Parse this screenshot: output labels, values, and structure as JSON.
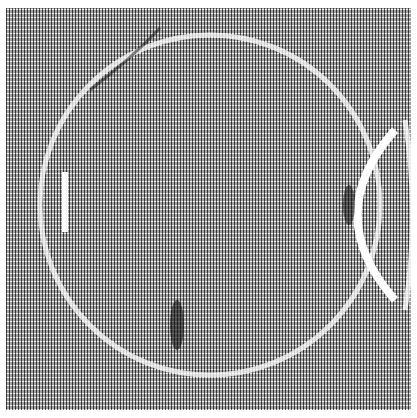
{
  "image": {
    "description": "Grayscale dithered texture resembling a rubbing of a circular carved surface with vertical hatch marks",
    "colors": {
      "ink": "#1a1a1a",
      "paper": "#ffffff",
      "mid": "#8a8a8a"
    },
    "features": [
      {
        "name": "large-arc-outline",
        "shape": "circle",
        "cx": 210,
        "cy": 205,
        "r": 170
      },
      {
        "name": "right-crescent",
        "shape": "arc",
        "cx": 390,
        "cy": 215,
        "r": 80
      },
      {
        "name": "left-light-bar",
        "x": 62,
        "y": 172,
        "w": 6,
        "h": 60
      },
      {
        "name": "dark-smudge-bottom",
        "x": 170,
        "y": 300,
        "w": 14,
        "h": 50
      },
      {
        "name": "dark-smudge-right",
        "x": 343,
        "y": 185,
        "w": 12,
        "h": 40
      }
    ]
  }
}
